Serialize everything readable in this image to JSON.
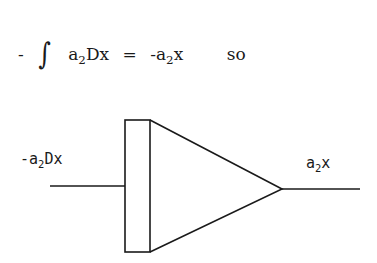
{
  "equation": {
    "minus": "-",
    "integral": "∫",
    "lhs_a": "a",
    "lhs_sub": "2",
    "lhs_rest": "Dx",
    "equals": "=",
    "rhs_prefix": "-a",
    "rhs_sub": "2",
    "rhs_rest": "x",
    "conclusion": "so"
  },
  "diagram": {
    "component": "integrator",
    "input_label": {
      "prefix": "-a",
      "sub": "2",
      "rest": "Dx"
    },
    "output_label": {
      "prefix": "a",
      "sub": "2",
      "rest": "x"
    },
    "stroke_color": "#1a1a1a"
  }
}
